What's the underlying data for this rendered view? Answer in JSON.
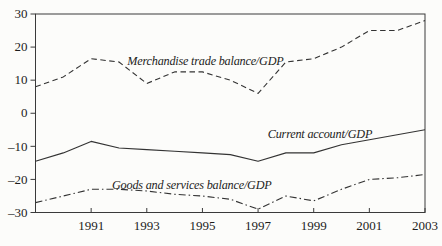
{
  "figure": {
    "background": "#fcfcfa",
    "line_color": "#333333",
    "frame_color": "#3a3a3a",
    "text_color": "#1c1c1c"
  },
  "chart_data": {
    "type": "line",
    "title": "",
    "xlabel": "",
    "ylabel": "",
    "grid": false,
    "legend_position": "in-plot-labels",
    "xlim": [
      1989,
      2003
    ],
    "ylim": [
      -30,
      30
    ],
    "x": [
      1989,
      1990,
      1991,
      1992,
      1993,
      1994,
      1995,
      1996,
      1997,
      1998,
      1999,
      2000,
      2001,
      2002,
      2003
    ],
    "xticks": {
      "values": [
        1991,
        1993,
        1995,
        1997,
        1999,
        2001,
        2003
      ],
      "labels": [
        "1991",
        "1993",
        "1995",
        "1997",
        "1999",
        "2001",
        "2003"
      ]
    },
    "yticks": {
      "values": [
        30,
        20,
        10,
        0,
        -10,
        -20,
        -30
      ],
      "labels": [
        "30",
        "20",
        "10",
        "0",
        "–10",
        "–20",
        "–30"
      ]
    },
    "series": [
      {
        "name": "Merchandise trade balance/GDP",
        "line_style": "dashed",
        "values": [
          8,
          11,
          16.5,
          15.5,
          9,
          12.5,
          12.5,
          10,
          6,
          15.5,
          16.5,
          20,
          25,
          25,
          28
        ]
      },
      {
        "name": "Current account/GDP",
        "line_style": "solid",
        "values": [
          -14.5,
          -12,
          -8.5,
          -10.5,
          -11,
          -11.5,
          -12,
          -12.5,
          -14.5,
          -12,
          -12,
          -9.5,
          -8,
          -6.5,
          -5
        ]
      },
      {
        "name": "Goods and services balance/GDP",
        "line_style": "dashdot",
        "values": [
          -27,
          -25,
          -23,
          -23,
          -23.5,
          -24.5,
          -25,
          -26,
          -29,
          -25,
          -26.5,
          -23,
          -20,
          -19.5,
          -18.5
        ]
      }
    ],
    "annotations": [
      {
        "text": "Merchandise trade balance/GDP",
        "x": 1992.3,
        "y": 14.5
      },
      {
        "text": "Current account/GDP",
        "x": 1997.35,
        "y": -7.6
      },
      {
        "text": "Goods and services balance/GDP",
        "x": 1991.75,
        "y": -22.8
      }
    ]
  }
}
